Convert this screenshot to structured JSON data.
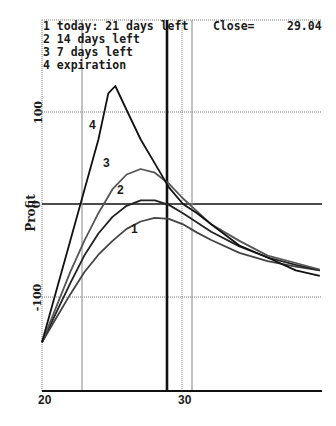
{
  "chart_data": {
    "type": "line",
    "title": "",
    "xlabel": "",
    "ylabel": "Profit",
    "xlim": [
      20,
      39.7
    ],
    "ylim": [
      -203,
      200
    ],
    "x_ticks": [
      "20",
      "30"
    ],
    "y_ticks": [
      "100",
      "0",
      "-100"
    ],
    "grid": true,
    "legend_position": "top-left",
    "legend": [
      {
        "num": "1",
        "text": "today: 21 days left"
      },
      {
        "num": "2",
        "text": "14 days left"
      },
      {
        "num": "3",
        "text": "7 days left"
      },
      {
        "num": "4",
        "text": "expiration"
      }
    ],
    "close_label": "Close=",
    "close_value": "29.04",
    "reference_lines": {
      "close_price_x": 29.04,
      "vertical_gray_x": [
        22.8,
        30.6
      ],
      "vertical_dotted_x": [
        30
      ],
      "zero_line_y": 0
    },
    "series": [
      {
        "name": "1",
        "label": "today: 21 days left",
        "x": [
          20,
          21,
          22,
          23,
          24,
          25,
          26,
          27,
          28,
          29,
          30,
          31,
          32,
          34,
          36,
          38,
          39.7
        ],
        "y": [
          -150,
          -124,
          -98,
          -74,
          -55,
          -40,
          -27,
          -19,
          -15,
          -16,
          -22,
          -31,
          -39,
          -53,
          -62,
          -68,
          -72
        ]
      },
      {
        "name": "2",
        "label": "14 days left",
        "x": [
          20,
          21,
          22,
          23,
          24,
          25,
          26,
          27,
          28,
          29,
          30,
          31,
          32,
          34,
          36,
          38,
          39.7
        ],
        "y": [
          -150,
          -118,
          -86,
          -56,
          -32,
          -14,
          -2,
          4,
          4,
          -1,
          -10,
          -20,
          -30,
          -46,
          -58,
          -66,
          -72
        ]
      },
      {
        "name": "3",
        "label": "7 days left",
        "x": [
          20,
          21,
          22,
          23,
          24,
          25,
          26,
          27,
          28,
          29,
          30,
          31,
          32,
          34,
          36,
          38,
          39.7
        ],
        "y": [
          -150,
          -112,
          -74,
          -40,
          -10,
          16,
          32,
          38,
          34,
          22,
          6,
          -8,
          -22,
          -40,
          -56,
          -64,
          -71
        ]
      },
      {
        "name": "4",
        "label": "expiration",
        "x": [
          20,
          21,
          22,
          23,
          24,
          24.7,
          25.2,
          26,
          27,
          28,
          29,
          30,
          31,
          32,
          34,
          36,
          38,
          39.7
        ],
        "y": [
          -150,
          -95,
          -40,
          15,
          70,
          120,
          128,
          102,
          70,
          44,
          18,
          0,
          -10,
          -22,
          -45,
          -58,
          -72,
          -78
        ]
      }
    ]
  },
  "labels": {
    "legend_1": "1 today: 21 days left",
    "legend_2": "2 14 days left",
    "legend_3": "3 7 days left",
    "legend_4": "4 expiration",
    "close_label": "Close=",
    "close_value": "29.04",
    "ylabel": "Profit",
    "ytick_100": "100",
    "ytick_0": "0",
    "ytick_m100": "-100",
    "xtick_20": "20",
    "xtick_30": "30",
    "curve_1": "1",
    "curve_2": "2",
    "curve_3": "3",
    "curve_4": "4"
  }
}
